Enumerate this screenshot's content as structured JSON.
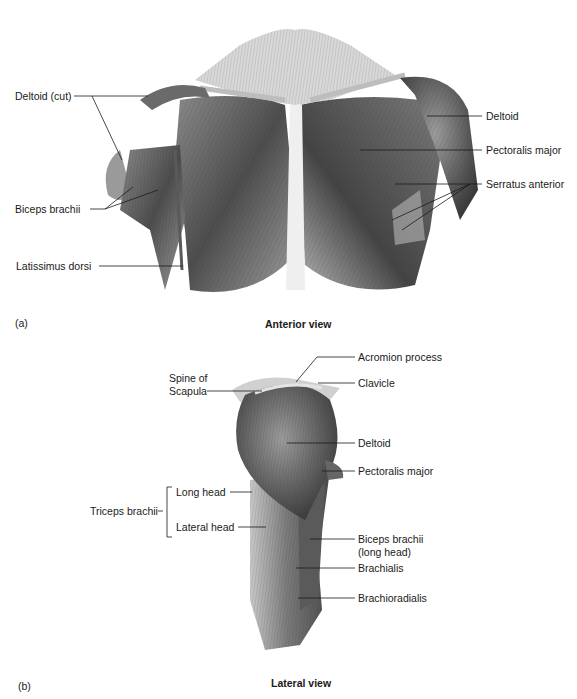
{
  "figure": {
    "panel_a": {
      "letter": "(a)",
      "caption": "Anterior view",
      "labels": {
        "deltoid_cut": "Deltoid (cut)",
        "biceps_brachii": "Biceps brachii",
        "latissimus_dorsi": "Latissimus dorsi",
        "deltoid": "Deltoid",
        "pectoralis_major": "Pectoralis major",
        "serratus_anterior": "Serratus anterior"
      }
    },
    "panel_b": {
      "letter": "(b)",
      "caption": "Lateral view",
      "labels": {
        "acromion_process": "Acromion process",
        "spine_of_scapula_1": "Spine of",
        "spine_of_scapula_2": "Scapula",
        "clavicle": "Clavicle",
        "deltoid": "Deltoid",
        "pectoralis_major": "Pectoralis major",
        "triceps_brachii": "Triceps brachii",
        "long_head": "Long head",
        "lateral_head": "Lateral head",
        "biceps_brachii_1": "Biceps brachii",
        "biceps_brachii_2": "(long head)",
        "brachialis": "Brachialis",
        "brachioradialis": "Brachioradialis"
      }
    }
  }
}
